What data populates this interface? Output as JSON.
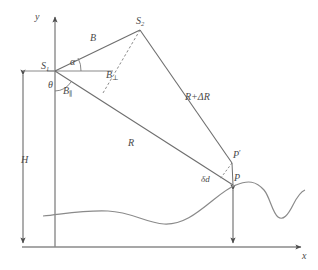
{
  "figure": {
    "type": "geometry-diagram",
    "stroke_color": "#6e6e6e",
    "label_color": "#4a4a4a",
    "background_color": "#ffffff"
  },
  "axes": {
    "y_label": "y",
    "x_label": "x",
    "origin": {
      "x": 55,
      "y": 247
    }
  },
  "points": {
    "s1": {
      "label": "S",
      "subscript": "1",
      "x": 55,
      "y": 71
    },
    "s2": {
      "label": "S",
      "subscript": "2",
      "x": 140,
      "y": 29
    },
    "p": {
      "label": "P",
      "x": 233,
      "y": 185
    },
    "p_prime": {
      "label": "P",
      "prime": "′",
      "x": 232,
      "y": 162
    }
  },
  "segments": {
    "baseline": {
      "label": "B",
      "from": "s1",
      "to": "s2"
    },
    "baseline_parallel": {
      "label": "B",
      "subscript": "∥"
    },
    "baseline_perpendicular": {
      "label": "B",
      "subscript": "⊥",
      "style": "dashed"
    },
    "range_near": {
      "label": "R",
      "from": "s1",
      "to": "p"
    },
    "range_far": {
      "label": "R+ΔR",
      "from": "s2",
      "to": "p_prime"
    },
    "displacement": {
      "label": "δd",
      "from": "p_prime",
      "to": "p",
      "style": "dashed"
    },
    "altitude": {
      "label": "H",
      "orientation": "vertical",
      "arrow": "double"
    },
    "terrain_height": {
      "orientation": "vertical",
      "arrow": "double"
    }
  },
  "angles": {
    "alpha": {
      "label": "α",
      "vertex": "s1",
      "position": "above-horizontal"
    },
    "theta": {
      "label": "θ",
      "vertex": "s1",
      "position": "below-vertical"
    }
  },
  "labels": {
    "y_axis": "y",
    "x_axis": "x",
    "s1": "S",
    "s1_sub": "1",
    "s2": "S",
    "s2_sub": "2",
    "alpha": "α",
    "theta": "θ",
    "b": "B",
    "b_perp": "B",
    "b_perp_sub": "⊥",
    "b_par": "B",
    "b_par_sub": "∥",
    "r": "R",
    "r_delta": "R+ΔR",
    "h": "H",
    "delta_d": "δd",
    "p": "P",
    "p_prime": "P",
    "p_prime_mark": "′"
  },
  "terrain": {
    "description": "undulating ground surface profile",
    "style": "solid curve"
  }
}
